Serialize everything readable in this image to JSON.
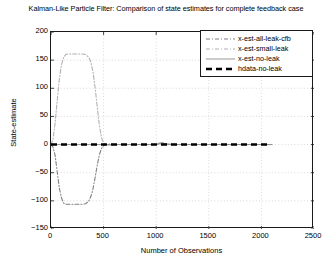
{
  "chart_data": {
    "type": "line",
    "title": "Kalman-Like Particle Filter: Comparison of state estimates for complete feedback case",
    "xlabel": "Number of Observations",
    "ylabel": "State-estimate",
    "xlim": [
      0,
      2500
    ],
    "ylim": [
      -150,
      200
    ],
    "xticks": [
      0,
      500,
      1000,
      1500,
      2000,
      2500
    ],
    "yticks": [
      -150,
      -100,
      -50,
      0,
      50,
      100,
      150,
      200
    ],
    "grid": true,
    "legend_position": "top-right",
    "series": [
      {
        "name": "x-est-all-leak-cfb",
        "color": "#808080",
        "style": "dash-dot",
        "width": 1.1,
        "x": [
          0,
          20,
          40,
          60,
          80,
          100,
          120,
          140,
          160,
          200,
          250,
          300,
          330,
          360,
          380,
          400,
          420,
          440,
          460,
          480,
          500,
          520,
          560,
          600,
          700,
          800,
          900,
          1000,
          1050,
          1100,
          1200,
          1300,
          1400,
          1500,
          1600,
          1700,
          1800,
          1900,
          2000,
          2100
        ],
        "values": [
          0,
          -5,
          -20,
          -50,
          -78,
          -95,
          -104,
          -106,
          -106,
          -106,
          -106,
          -106,
          -105,
          -100,
          -92,
          -78,
          -58,
          -36,
          -18,
          -7,
          -2,
          0,
          1,
          0,
          0,
          0,
          0,
          0,
          4,
          1,
          0,
          0,
          0,
          0,
          0,
          0,
          0,
          0,
          0,
          0
        ]
      },
      {
        "name": "x-est-small-leak",
        "color": "#b0b0b0",
        "style": "dash-dot",
        "width": 1.1,
        "x": [
          0,
          20,
          40,
          60,
          80,
          100,
          120,
          140,
          160,
          200,
          250,
          300,
          330,
          360,
          380,
          400,
          420,
          440,
          460,
          480,
          500,
          520,
          560,
          600,
          700,
          800,
          900,
          1000,
          1050,
          1100,
          1200,
          1300,
          1400,
          1500,
          1600,
          1700,
          1800,
          1900,
          2000,
          2100
        ],
        "values": [
          0,
          10,
          40,
          80,
          118,
          142,
          155,
          160,
          161,
          161,
          161,
          161,
          160,
          155,
          146,
          128,
          100,
          66,
          34,
          12,
          3,
          0,
          -1,
          0,
          0,
          0,
          0,
          0,
          3,
          1,
          0,
          0,
          0,
          0,
          0,
          0,
          0,
          0,
          0,
          0
        ]
      },
      {
        "name": "x-est-no-leak",
        "color": "#8c8c8c",
        "style": "solid",
        "width": 0.9,
        "x": [
          0,
          100,
          200,
          300,
          400,
          500,
          600,
          700,
          800,
          900,
          1000,
          1050,
          1100,
          1200,
          1300,
          1400,
          1500,
          1600,
          1700,
          1800,
          1900,
          2000,
          2100
        ],
        "values": [
          0,
          0,
          0,
          0,
          0,
          0,
          0,
          0,
          0,
          0,
          0,
          2,
          0,
          0,
          0,
          0,
          0,
          0,
          0,
          0,
          0,
          0,
          0
        ]
      },
      {
        "name": "hdata-no-leak",
        "color": "#000000",
        "style": "dashed-thick",
        "width": 2.6,
        "x": [
          0,
          200,
          400,
          600,
          800,
          1000,
          1200,
          1400,
          1600,
          1800,
          2000,
          2080
        ],
        "values": [
          0,
          0,
          0,
          0,
          0,
          0,
          0,
          0,
          0,
          0,
          0,
          0
        ]
      }
    ]
  },
  "legend": {
    "items": [
      {
        "label": "x-est-all-leak-cfb",
        "sample": "dash-dot-gray"
      },
      {
        "label": "x-est-small-leak",
        "sample": "dash-dot-lightgray"
      },
      {
        "label": "x-est-no-leak",
        "sample": "solid-thin"
      },
      {
        "label": "hdata-no-leak",
        "sample": "dashed-thick-black"
      }
    ]
  }
}
